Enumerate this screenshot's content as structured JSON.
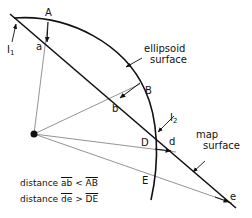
{
  "diagram": {
    "title": "",
    "labels": {
      "I1": "I",
      "I1_sub": "1",
      "I2": "I",
      "I2_sub": "2",
      "A": "A",
      "a": "a",
      "B": "B",
      "b": "b",
      "D": "D",
      "d": "d",
      "E": "E",
      "e": "e",
      "ellipsoid_line1": "ellipsoid",
      "ellipsoid_line2": "surface",
      "map_line1": "map",
      "map_line2": "surface"
    },
    "captions": [
      {
        "prefix": "distance",
        "left": "ab",
        "op": "<",
        "right": "AB"
      },
      {
        "prefix": "distance",
        "left": "de",
        "op": ">",
        "right": "DE"
      }
    ],
    "colors": {
      "line": "#111111",
      "ray": "#777777"
    }
  }
}
